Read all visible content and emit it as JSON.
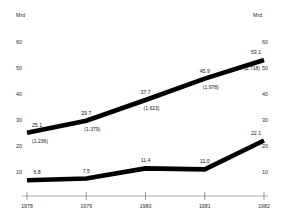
{
  "axes": {
    "unit_label_left": "Mrd",
    "unit_label_right": "Mrd",
    "y_ticks": [
      60,
      50,
      40,
      30,
      20,
      10
    ],
    "x_labels": [
      "1978",
      "1979",
      "1980",
      "1981",
      "1982"
    ]
  },
  "labels": {
    "upper": [
      {
        "value": "25.1",
        "sub": "(1.236)"
      },
      {
        "value": "29.7",
        "sub": "(1.379)"
      },
      {
        "value": "37.7",
        "sub": "(1.623)"
      },
      {
        "value": "45.9",
        "sub": "(1.978)"
      },
      {
        "value": "53.1",
        "sub": "(2.718)"
      }
    ],
    "lower": [
      {
        "value": "6.8",
        "sub": ""
      },
      {
        "value": "7.5",
        "sub": ""
      },
      {
        "value": "11.4",
        "sub": ""
      },
      {
        "value": "11.0",
        "sub": ""
      },
      {
        "value": "22.1",
        "sub": ""
      }
    ]
  },
  "chart_data": {
    "type": "line",
    "title": "",
    "xlabel": "",
    "ylabel": "Mrd",
    "categories": [
      "1978",
      "1979",
      "1980",
      "1981",
      "1982"
    ],
    "ylim": [
      0,
      65
    ],
    "grid": false,
    "legend": "none",
    "series": [
      {
        "name": "upper",
        "values": [
          25.1,
          29.7,
          37.7,
          45.9,
          53.1
        ],
        "secondary_values": [
          1.236,
          1.379,
          1.623,
          1.978,
          2.718
        ],
        "color": "#000000"
      },
      {
        "name": "lower",
        "values": [
          6.8,
          7.5,
          11.4,
          11.0,
          22.1
        ],
        "secondary_values": [],
        "color": "#000000"
      }
    ]
  }
}
